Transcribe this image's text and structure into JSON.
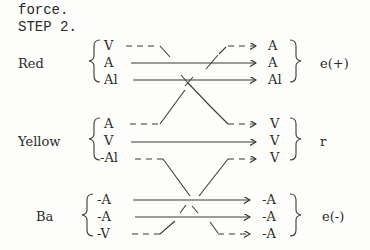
{
  "header": {
    "line1": "force.",
    "line2": "STEP 2."
  },
  "groups": [
    {
      "label": "Red",
      "left": [
        "V",
        "A",
        "Al"
      ],
      "right": [
        "A",
        "A",
        "Al"
      ],
      "result": "e(+)"
    },
    {
      "label": "Yellow",
      "left": [
        "A",
        "V",
        "-Al"
      ],
      "right": [
        "V",
        "V",
        "V"
      ],
      "result": "r"
    },
    {
      "label": "Ba",
      "left": [
        "-A",
        "-A",
        "-V"
      ],
      "right": [
        "-A",
        "-A",
        "-A"
      ],
      "result": "e(-)"
    }
  ]
}
